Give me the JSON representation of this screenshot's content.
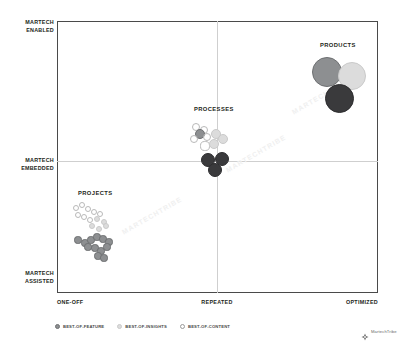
{
  "chart_data": {
    "type": "scatter",
    "title": "",
    "xlabel": "",
    "ylabel": "",
    "grid": true,
    "legend_position": "bottom-left",
    "x_ticks": [
      "ONE-OFF",
      "REPEATED",
      "OPTIMIZED"
    ],
    "y_ticks": [
      "MARTECH ENABLED",
      "MARTECH EMBEDDED",
      "MARTECH ASSISTED"
    ],
    "xlim": [
      0,
      2
    ],
    "ylim": [
      0,
      2
    ],
    "series": [
      {
        "name": "BEST-OF-FEATURE",
        "color": "#8d8f91",
        "style": "filled-medium"
      },
      {
        "name": "BEST-OF-INSIGHTS",
        "color": "#dcdcdc",
        "style": "filled-light"
      },
      {
        "name": "BEST-OF-CONTENT",
        "color": "#ffffff",
        "style": "open-outline"
      }
    ],
    "cluster_labels": [
      "PROJECTS",
      "PROCESSES",
      "PRODUCTS"
    ],
    "clusters": [
      {
        "label": "PROJECTS",
        "label_x": 97,
        "label_y": 194,
        "points": [
          {
            "series": "BEST-OF-CONTENT",
            "x": 76,
            "y": 208,
            "r": 3.4
          },
          {
            "series": "BEST-OF-CONTENT",
            "x": 82,
            "y": 205,
            "r": 3.4
          },
          {
            "series": "BEST-OF-CONTENT",
            "x": 88,
            "y": 209,
            "r": 3.4
          },
          {
            "series": "BEST-OF-CONTENT",
            "x": 94,
            "y": 212,
            "r": 3.4
          },
          {
            "series": "BEST-OF-CONTENT",
            "x": 100,
            "y": 214,
            "r": 3.4
          },
          {
            "series": "BEST-OF-CONTENT",
            "x": 78,
            "y": 215,
            "r": 3.4
          },
          {
            "series": "BEST-OF-CONTENT",
            "x": 84,
            "y": 217,
            "r": 3.4
          },
          {
            "series": "BEST-OF-CONTENT",
            "x": 90,
            "y": 220,
            "r": 3.4
          },
          {
            "series": "BEST-OF-INSIGHTS",
            "x": 97,
            "y": 219,
            "r": 3.4
          },
          {
            "series": "BEST-OF-INSIGHTS",
            "x": 104,
            "y": 222,
            "r": 3.4
          },
          {
            "series": "BEST-OF-INSIGHTS",
            "x": 92,
            "y": 226,
            "r": 3.4
          },
          {
            "series": "BEST-OF-INSIGHTS",
            "x": 99,
            "y": 229,
            "r": 3.4
          },
          {
            "series": "BEST-OF-INSIGHTS",
            "x": 106,
            "y": 226,
            "r": 3.4
          },
          {
            "series": "BEST-OF-FEATURE",
            "x": 78,
            "y": 240,
            "r": 3.6
          },
          {
            "series": "BEST-OF-FEATURE",
            "x": 85,
            "y": 243,
            "r": 3.6
          },
          {
            "series": "BEST-OF-FEATURE",
            "x": 91,
            "y": 240,
            "r": 3.6
          },
          {
            "series": "BEST-OF-FEATURE",
            "x": 97,
            "y": 237,
            "r": 3.6
          },
          {
            "series": "BEST-OF-FEATURE",
            "x": 103,
            "y": 239,
            "r": 3.6
          },
          {
            "series": "BEST-OF-FEATURE",
            "x": 109,
            "y": 242,
            "r": 3.6
          },
          {
            "series": "BEST-OF-FEATURE",
            "x": 88,
            "y": 247,
            "r": 3.6
          },
          {
            "series": "BEST-OF-FEATURE",
            "x": 95,
            "y": 248,
            "r": 3.6
          },
          {
            "series": "BEST-OF-FEATURE",
            "x": 101,
            "y": 251,
            "r": 3.6
          },
          {
            "series": "BEST-OF-FEATURE",
            "x": 107,
            "y": 247,
            "r": 3.6
          },
          {
            "series": "BEST-OF-FEATURE",
            "x": 98,
            "y": 256,
            "r": 3.6
          },
          {
            "series": "BEST-OF-FEATURE",
            "x": 104,
            "y": 258,
            "r": 3.6
          }
        ]
      },
      {
        "label": "PROCESSES",
        "label_x": 215,
        "label_y": 110,
        "points": [
          {
            "series": "BEST-OF-CONTENT",
            "x": 196,
            "y": 127,
            "r": 4.2
          },
          {
            "series": "BEST-OF-CONTENT",
            "x": 204,
            "y": 130,
            "r": 4.2
          },
          {
            "series": "BEST-OF-FEATURE",
            "x": 200,
            "y": 134,
            "r": 5.0
          },
          {
            "series": "BEST-OF-CONTENT",
            "x": 194,
            "y": 139,
            "r": 4.2
          },
          {
            "series": "BEST-OF-CONTENT",
            "x": 207,
            "y": 137,
            "r": 4.2
          },
          {
            "series": "BEST-OF-INSIGHTS",
            "x": 216,
            "y": 134,
            "r": 5.4
          },
          {
            "series": "BEST-OF-INSIGHTS",
            "x": 223,
            "y": 139,
            "r": 5.4
          },
          {
            "series": "BEST-OF-CONTENT",
            "x": 205,
            "y": 146,
            "r": 4.6
          },
          {
            "series": "BEST-OF-INSIGHTS",
            "x": 214,
            "y": 144,
            "r": 5.0
          },
          {
            "series": "BEST-OF-DARK",
            "x": 208,
            "y": 160,
            "r": 7.0
          },
          {
            "series": "BEST-OF-DARK",
            "x": 222,
            "y": 159,
            "r": 7.4
          },
          {
            "series": "BEST-OF-DARK",
            "x": 215,
            "y": 170,
            "r": 7.0
          }
        ]
      },
      {
        "label": "PRODUCTS",
        "label_x": 340,
        "label_y": 46,
        "points": [
          {
            "series": "BEST-OF-FEATURE",
            "x": 327,
            "y": 72,
            "r": 15.0
          },
          {
            "series": "BEST-OF-INSIGHTS",
            "x": 352,
            "y": 76,
            "r": 14.0
          },
          {
            "series": "BEST-OF-DARK",
            "x": 339,
            "y": 98,
            "r": 14.5
          }
        ]
      }
    ]
  },
  "axes": {
    "y_top": "MARTECH\nENABLED",
    "y_top_line1": "MARTECH",
    "y_top_line2": "ENABLED",
    "y_mid_line1": "MARTECH",
    "y_mid_line2": "EMBEDDED",
    "y_bot_line1": "MARTECH",
    "y_bot_line2": "ASSISTED",
    "x_left": "ONE-OFF",
    "x_mid": "REPEATED",
    "x_right": "OPTIMIZED"
  },
  "clusters": {
    "projects": "PROJECTS",
    "processes": "PROCESSES",
    "products": "PRODUCTS"
  },
  "legend": {
    "items": [
      {
        "label": "BEST-OF-FEATURE",
        "swatch": "s-feature"
      },
      {
        "label": "BEST-OF-INSIGHTS",
        "swatch": "s-insights"
      },
      {
        "label": "BEST-OF-CONTENT",
        "swatch": "s-content"
      }
    ]
  },
  "brand": {
    "name": "MartechTribe",
    "mark": "compass-diamond-icon"
  },
  "watermarks": [
    "MARTECHTRIBE",
    "MARTECHTRIBE",
    "MARTECHTRIBE"
  ],
  "colors": {
    "feature": "#8d8f91",
    "insights": "#dcdcdc",
    "content": "#ffffff",
    "dark": "#3a3a3c",
    "frame": "#4a4a4a",
    "grid": "#cfcfcf",
    "text": "#231f20"
  }
}
